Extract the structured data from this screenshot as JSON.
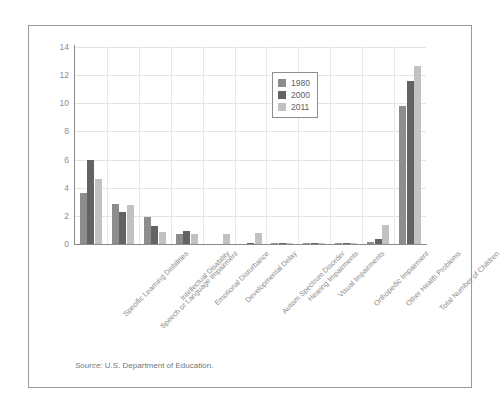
{
  "chart_data": {
    "type": "bar",
    "title": "",
    "xlabel": "",
    "ylabel": "",
    "ylim": [
      0,
      14
    ],
    "yticks": [
      "0",
      "2",
      "4",
      "6",
      "8",
      "10",
      "12",
      "14"
    ],
    "grid": true,
    "legend_position": "top-center",
    "categories": [
      "Specific Learning Disbilities",
      "Speech or Language Impairment",
      "Intellectual Disability",
      "Emotional Disturbance",
      "Developmental Delay",
      "Autism Spectrum Disorder",
      "Hearing Impairments",
      "Visual Impairments",
      "Orthopedic Impairment",
      "Other Health Problems",
      "Total Number of Children"
    ],
    "series": [
      {
        "name": "1980",
        "color": "#8d8d8d",
        "values": [
          3.6,
          2.85,
          1.95,
          0.7,
          0.0,
          0.0,
          0.1,
          0.05,
          0.07,
          0.12,
          9.8
        ]
      },
      {
        "name": "2000",
        "color": "#636363",
        "values": [
          6.0,
          2.25,
          1.25,
          0.95,
          0.0,
          0.08,
          0.1,
          0.04,
          0.08,
          0.38,
          11.6
        ]
      },
      {
        "name": "2011",
        "color": "#c2c2c2",
        "values": [
          4.6,
          2.75,
          0.85,
          0.7,
          0.68,
          0.78,
          0.08,
          0.04,
          0.07,
          1.35,
          12.65
        ]
      }
    ]
  },
  "source": {
    "label": "Source:",
    "text": "U.S. Department of Education."
  }
}
